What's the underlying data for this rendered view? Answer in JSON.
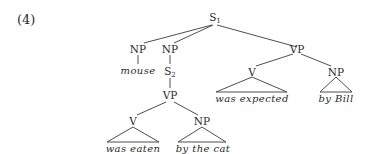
{
  "example_number": "(4)",
  "tree": {
    "root": {
      "label": "S",
      "subscript": "1"
    },
    "np_mouse": {
      "label": "NP",
      "word": "mouse"
    },
    "np_s2": {
      "label": "NP"
    },
    "s2": {
      "label": "S",
      "subscript": "2"
    },
    "vp_lower": {
      "label": "VP"
    },
    "v_lower": {
      "label": "V",
      "word": "was eaten"
    },
    "np_lower": {
      "label": "NP",
      "word": "by the cat"
    },
    "vp_upper": {
      "label": "VP"
    },
    "v_upper": {
      "label": "V",
      "word": "was expected"
    },
    "np_upper": {
      "label": "NP",
      "word": "by Bill"
    }
  },
  "colors": {
    "line": "#3a3a3a",
    "text": "#2a2a2a"
  }
}
